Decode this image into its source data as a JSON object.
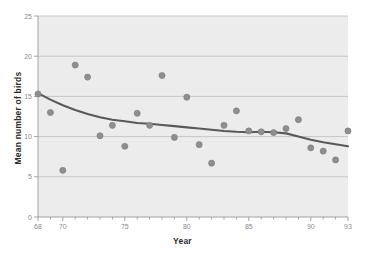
{
  "chart_data": {
    "type": "scatter",
    "title": "",
    "xlabel": "Year",
    "ylabel": "Mean number of birds",
    "xlim": [
      68,
      93
    ],
    "ylim": [
      0,
      25
    ],
    "xticks": [
      68,
      70,
      75,
      80,
      85,
      90,
      93
    ],
    "xtick_labels": [
      "68",
      "70",
      "75",
      "80",
      "85",
      "90",
      "93"
    ],
    "yticks": [
      0,
      5,
      10,
      15,
      20,
      25
    ],
    "ytick_labels": [
      "0",
      "5",
      "10",
      "15",
      "20",
      "25"
    ],
    "x_minor_tick_step": 1,
    "grid": "horizontal",
    "legend": "none",
    "plot_background": "#ececec",
    "point_color": "#8e8e8e",
    "point_edge_color": "#7a7a7a",
    "trend_line_color": "#595959",
    "grid_color": "#b6b6b6",
    "axis_color": "#9a9a9a",
    "tick_label_color": "#8c8c8c",
    "x": [
      68,
      69,
      70,
      71,
      72,
      73,
      74,
      75,
      76,
      77,
      78,
      79,
      80,
      81,
      82,
      83,
      84,
      85,
      86,
      87,
      88,
      89,
      90,
      91,
      92,
      93
    ],
    "y": [
      15.3,
      13.0,
      5.8,
      18.9,
      17.4,
      10.1,
      11.4,
      8.8,
      12.9,
      11.4,
      17.6,
      9.9,
      14.9,
      9.0,
      6.7,
      11.4,
      13.2,
      10.7,
      10.6,
      10.5,
      11.0,
      12.1,
      8.6,
      8.2,
      7.1,
      10.7
    ],
    "series": [
      {
        "name": "Mean number of birds",
        "type": "scatter",
        "values": [
          15.3,
          13.0,
          5.8,
          18.9,
          17.4,
          10.1,
          11.4,
          8.8,
          12.9,
          11.4,
          17.6,
          9.9,
          14.9,
          9.0,
          6.7,
          11.4,
          13.2,
          10.7,
          10.6,
          10.5,
          11.0,
          12.1,
          8.6,
          8.2,
          7.1,
          10.7
        ]
      },
      {
        "name": "smoothed trend",
        "type": "line",
        "x": [
          68,
          69,
          70,
          71,
          72,
          73,
          74,
          75,
          76,
          77,
          78,
          79,
          80,
          81,
          82,
          83,
          84,
          85,
          86,
          87,
          88,
          89,
          90,
          91,
          92,
          93
        ],
        "values": [
          15.4,
          14.6,
          13.9,
          13.3,
          12.8,
          12.4,
          12.1,
          11.9,
          11.7,
          11.6,
          11.45,
          11.3,
          11.15,
          11.0,
          10.85,
          10.7,
          10.6,
          10.55,
          10.6,
          10.55,
          10.4,
          10.0,
          9.6,
          9.3,
          9.05,
          8.8
        ]
      }
    ]
  }
}
